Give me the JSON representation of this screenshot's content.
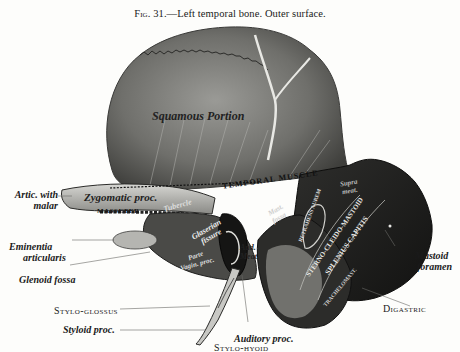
{
  "caption": {
    "figure_number": "Fig. 31.",
    "title": "—Left temporal bone.   Outer surface."
  },
  "figure": {
    "inner_labels": {
      "squamous_portion": "Squamous Portion",
      "temporal_muscle": "TEMPORAL MUSCLE",
      "zygomatic_proc": "Zygomatic proc.",
      "masseter": "MASSETER",
      "tubercle": "Tubercle",
      "glaserian_fissure_1": "Glaserian",
      "glaserian_fissure_2": "fissure",
      "postglenoid_1": "Parte",
      "postglenoid_2": "Vagin. proc.",
      "aud_meat_1": "Aud.",
      "aud_meat_2": "Meat.",
      "suprameatal_1": "Supra",
      "suprameatal_2": "meat.",
      "mastoid_1": "Mast.",
      "mastoid_2": "fossa",
      "retrahens_aurem": "RETRAHENS AUREM",
      "sterno_cleido_mastoid": "STERNO-CLEIDO-MASTOID",
      "splenius_capitis": "SPLENIUS CAPITIS",
      "trachelomastoid": "TRACHELOMAST."
    },
    "outer_labels": {
      "artic_malar_1": "Artic. with",
      "artic_malar_2": "malar",
      "eminentia_1": "Eminentia",
      "eminentia_2": "articularis",
      "glenoid_fossa": "Glenoid fossa",
      "stylo_glossus": "Stylo-glossus",
      "styloid_proc": "Styloid proc.",
      "auditory_proc": "Auditory proc.",
      "stylo_hyoid": "Stylo-hyoid",
      "mastoid_foramen_1": "Mastoid",
      "mastoid_foramen_2": "foramen",
      "digastric": "Digastric"
    }
  }
}
